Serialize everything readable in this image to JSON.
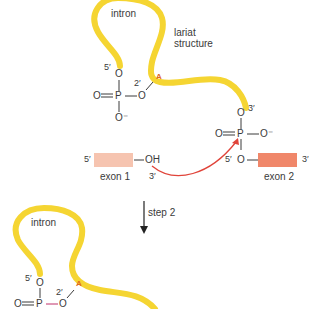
{
  "figure": {
    "stage1": {
      "intron_label": "intron",
      "lariat_label_line1": "lariat",
      "lariat_label_line2": "structure",
      "branch_base": "A",
      "intron_5prime": "5′",
      "intron_O_top": "O",
      "phosphate_left_O": "O",
      "phosphate_P": "P",
      "phosphate_right_O": "O",
      "phosphate_bottom_O": "O⁻",
      "branch_2prime": "2′",
      "lariat_3prime_O": "O",
      "lariat_3prime": "3′",
      "exon2_phosphate_left_O": "O",
      "exon2_phosphate_P": "P",
      "exon2_phosphate_right_O": "O⁻",
      "exon2_5prime": "5′",
      "exon2_O": "O",
      "exon2_3prime": "3′",
      "exon2_label": "exon 2",
      "exon1_5prime": "5′",
      "exon1_OH": "OH",
      "exon1_3prime": "3′",
      "exon1_label": "exon 1"
    },
    "step_label": "step 2",
    "stage2": {
      "intron_label": "intron",
      "branch_base": "A",
      "intron_5prime": "5′",
      "intron_O_top": "O",
      "phosphate_left_O": "O",
      "phosphate_P": "P",
      "phosphate_right_O": "O",
      "branch_2prime": "2′"
    },
    "colors": {
      "intron": "#f5d532",
      "exon1": "#f6c4b0",
      "exon2": "#f0876a",
      "arrow": "#e0443a",
      "branch_A": "#e06a1e",
      "text": "#3a3a3a"
    }
  }
}
